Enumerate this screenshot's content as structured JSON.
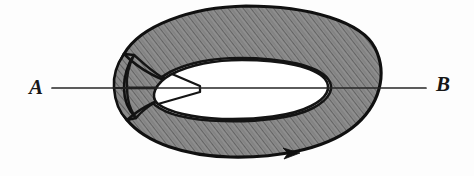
{
  "figure": {
    "type": "mobius-strip-diagram",
    "caption_labels": {
      "left_label": "A",
      "right_label": "B"
    },
    "background_color": "#fdfdfd",
    "band": {
      "fill_color": "#8a8a8a",
      "hatch_color": "#5c5c5c",
      "outline_color": "#101010",
      "outline_width_px": 3,
      "hatch_direction": "diagonal-lower-left-to-upper-right",
      "hole_fill_color": "#ffffff"
    },
    "line_ab": {
      "color": "#262626",
      "width_px": 1.6,
      "start_x": 52,
      "end_x": 426,
      "y": 88,
      "description": "straight line through the strip from A to B"
    },
    "orientation_arrow": {
      "x": 292,
      "y": 153,
      "direction": "right",
      "color": "#101010"
    },
    "geometry": {
      "outer_left_x": 113,
      "outer_right_x": 379,
      "outer_top_y": 6,
      "outer_bottom_y": 157,
      "hole_left_x": 150,
      "hole_right_x": 329,
      "hole_top_y": 58,
      "hole_bottom_y": 120,
      "twist_node_x": 127,
      "twist_node_y": 88
    }
  }
}
